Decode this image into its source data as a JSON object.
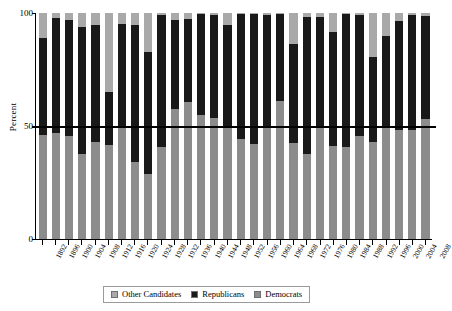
{
  "chart_data": {
    "type": "bar",
    "stacked": true,
    "title": "",
    "xlabel": "",
    "ylabel": "Percent",
    "ylim": [
      0,
      100
    ],
    "yticks": [
      0,
      50,
      100
    ],
    "ytick_labels": [
      "0",
      "50",
      "100"
    ],
    "gridlines": [
      "50"
    ],
    "reference_line": 50,
    "legend_position": "bottom-center",
    "legend": [
      "Other Candidates",
      "Republicans",
      "Democrats"
    ],
    "colors": {
      "other": "#a9a9a9",
      "republicans": "#191919",
      "democrats": "#8c8c8c",
      "axis": "#000000",
      "grid": "#c9c9c9"
    },
    "categories": [
      "1892",
      "1896",
      "1900",
      "1904",
      "1908",
      "1912",
      "1916",
      "1920",
      "1924",
      "1928",
      "1932",
      "1936",
      "1940",
      "1944",
      "1948",
      "1952",
      "1956",
      "1960",
      "1964",
      "1968",
      "1972",
      "1976",
      "1980",
      "1984",
      "1988",
      "1992",
      "1996",
      "2000",
      "2004",
      "2008"
    ],
    "series": [
      {
        "name": "Democrats",
        "values": [
          46.0,
          46.7,
          45.5,
          37.6,
          43.0,
          41.8,
          49.2,
          34.2,
          28.8,
          40.8,
          57.4,
          60.8,
          54.7,
          53.4,
          49.6,
          44.3,
          42.0,
          49.7,
          61.1,
          42.7,
          37.5,
          50.1,
          41.0,
          40.6,
          45.6,
          43.0,
          49.2,
          48.4,
          48.3,
          52.9
        ]
      },
      {
        "name": "Republicans",
        "values": [
          43.0,
          51.0,
          51.6,
          56.4,
          51.6,
          23.2,
          46.1,
          60.3,
          54.0,
          58.2,
          39.6,
          36.5,
          44.8,
          45.9,
          45.1,
          55.2,
          57.4,
          49.5,
          38.5,
          43.4,
          60.7,
          48.0,
          50.7,
          58.8,
          53.4,
          37.4,
          40.7,
          47.9,
          50.7,
          45.7
        ]
      },
      {
        "name": "Other Candidates",
        "values": [
          11.0,
          2.3,
          2.9,
          6.0,
          5.4,
          35.0,
          4.7,
          5.5,
          17.2,
          1.0,
          3.0,
          2.7,
          0.5,
          0.7,
          5.3,
          0.5,
          0.6,
          0.8,
          0.4,
          13.9,
          1.8,
          1.9,
          8.3,
          0.6,
          1.0,
          19.6,
          10.1,
          3.7,
          1.0,
          1.4
        ]
      }
    ]
  },
  "axis": {
    "y_title": "Percent"
  },
  "legend": {
    "items": [
      {
        "label": "Other Candidates",
        "key": "other"
      },
      {
        "label": "Republicans",
        "key": "republicans"
      },
      {
        "label": "Democrats",
        "key": "democrats"
      }
    ]
  }
}
